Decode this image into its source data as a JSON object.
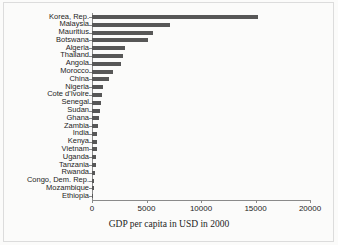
{
  "chart_data": {
    "type": "bar",
    "orientation": "horizontal",
    "title": "",
    "xlabel": "GDP per capita in USD in 2000",
    "ylabel": "",
    "xlim": [
      0,
      20000
    ],
    "xticks": [
      0,
      5000,
      10000,
      15000,
      20000
    ],
    "xtick_labels": [
      "0",
      "5000",
      "10000",
      "15000",
      "20000"
    ],
    "grid": false,
    "legend": false,
    "bar_color": "#575757",
    "categories": [
      "Korea, Rep.",
      "Malaysia",
      "Mauritius",
      "Botswana",
      "Algeria",
      "Thailand",
      "Angola",
      "Morocco",
      "China",
      "Nigeria",
      "Cote d'Ivoire",
      "Senegal",
      "Sudan",
      "Ghana",
      "Zambia",
      "India",
      "Kenya",
      "Vietnam",
      "Uganda",
      "Tanzania",
      "Rwanda",
      "Congo, Dem. Rep.",
      "Mozambique",
      "Ethiopia"
    ],
    "values": [
      15200,
      7200,
      5600,
      5100,
      3000,
      2800,
      2700,
      1900,
      1550,
      1050,
      950,
      800,
      700,
      620,
      560,
      500,
      460,
      420,
      380,
      330,
      260,
      200,
      170,
      130
    ]
  }
}
